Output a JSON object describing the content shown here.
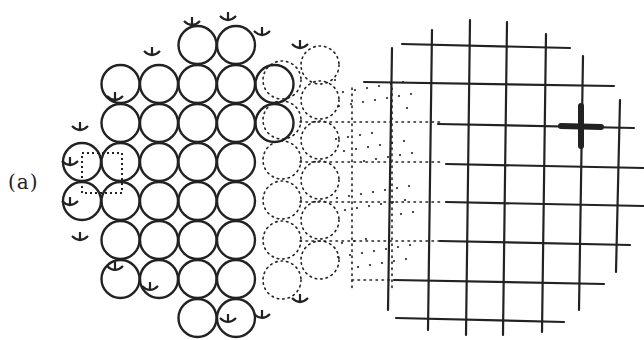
{
  "figure": {
    "panel_label": "(a)",
    "colors": {
      "ink": "#222222",
      "background": "#ffffff"
    },
    "circle_array": {
      "origin_x": 100,
      "origin_y": 45,
      "spacing_x": 38.5,
      "spacing_y": 39,
      "radius": 19,
      "rows": [
        {
          "y_index": 0,
          "cols": [
            3,
            4
          ]
        },
        {
          "y_index": 1,
          "cols": [
            1,
            2,
            3,
            4,
            5
          ]
        },
        {
          "y_index": 2,
          "cols": [
            1,
            2,
            3,
            4,
            5
          ]
        },
        {
          "y_index": 3,
          "cols": [
            0,
            1,
            2,
            3,
            4
          ]
        },
        {
          "y_index": 4,
          "cols": [
            0,
            1,
            2,
            3,
            4
          ]
        },
        {
          "y_index": 5,
          "cols": [
            1,
            2,
            3,
            4
          ]
        },
        {
          "y_index": 6,
          "cols": [
            1,
            2,
            3,
            4
          ]
        },
        {
          "y_index": 7,
          "cols": [
            3,
            4
          ]
        }
      ]
    },
    "unit_cell": {
      "x": 82,
      "y": 153,
      "w": 40,
      "h": 40,
      "style": "dotted"
    },
    "grid": {
      "vertical_lines": [
        {
          "x": 432,
          "y1": 30,
          "y2": 330
        },
        {
          "x": 470,
          "y1": 20,
          "y2": 335
        },
        {
          "x": 507,
          "y1": 22,
          "y2": 335
        },
        {
          "x": 546,
          "y1": 34,
          "y2": 332
        },
        {
          "x": 583,
          "y1": 56,
          "y2": 310
        },
        {
          "x": 620,
          "y1": 100,
          "y2": 272
        },
        {
          "x": 392,
          "y1": 48,
          "y2": 310
        }
      ],
      "horizontal_lines": [
        {
          "y": 44,
          "x1": 402,
          "x2": 570
        },
        {
          "y": 82,
          "x1": 364,
          "x2": 614
        },
        {
          "y": 124,
          "x1": 438,
          "x2": 634
        },
        {
          "y": 164,
          "x1": 446,
          "x2": 644
        },
        {
          "y": 202,
          "x1": 446,
          "x2": 644
        },
        {
          "y": 241,
          "x1": 440,
          "x2": 630
        },
        {
          "y": 280,
          "x1": 394,
          "x2": 604
        },
        {
          "y": 318,
          "x1": 396,
          "x2": 564
        }
      ]
    },
    "marker": {
      "shape": "cross",
      "x": 581,
      "y": 126,
      "arm": 20,
      "stroke": 6
    }
  }
}
